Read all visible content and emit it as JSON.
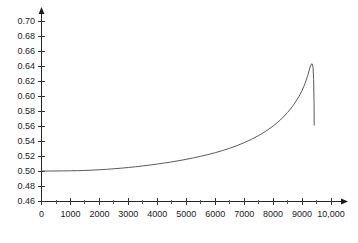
{
  "chart_data": {
    "type": "line",
    "title": "",
    "subtitle": "",
    "xlabel": "",
    "ylabel": "",
    "xlim": [
      0,
      10000
    ],
    "ylim": [
      0.46,
      0.71
    ],
    "grid": false,
    "legend": null,
    "x_tick_labels": [
      "0",
      "1000",
      "2000",
      "3000",
      "4000",
      "5000",
      "6000",
      "7000",
      "8000",
      "9000",
      "10,000"
    ],
    "x_tick_values": [
      0,
      1000,
      2000,
      3000,
      4000,
      5000,
      6000,
      7000,
      8000,
      9000,
      10000
    ],
    "x_minor_tick_values": [
      500,
      1500,
      2500,
      3500,
      4500,
      5500,
      6500,
      7500,
      8500,
      9500
    ],
    "y_tick_labels": [
      "0.46",
      "0.48",
      "0.50",
      "0.52",
      "0.54",
      "0.56",
      "0.58",
      "0.60",
      "0.62",
      "0.64",
      "0.66",
      "0.68",
      "0.70"
    ],
    "y_tick_values": [
      0.46,
      0.48,
      0.5,
      0.52,
      0.54,
      0.56,
      0.58,
      0.6,
      0.62,
      0.64,
      0.66,
      0.68,
      0.7
    ],
    "series": [
      {
        "name": "curve",
        "color": "#5a5a5a",
        "x": [
          0,
          250,
          500,
          750,
          1000,
          1250,
          1500,
          1750,
          2000,
          2250,
          2500,
          2750,
          3000,
          3250,
          3500,
          3750,
          4000,
          4250,
          4500,
          4750,
          5000,
          5250,
          5500,
          5750,
          6000,
          6250,
          6500,
          6750,
          7000,
          7250,
          7500,
          7750,
          8000,
          8250,
          8500,
          8700,
          8900,
          9000,
          9100,
          9200,
          9280,
          9330,
          9360,
          9380,
          9400,
          9415,
          9420
        ],
        "y": [
          0.5005,
          0.5005,
          0.5006,
          0.5007,
          0.5008,
          0.501,
          0.5013,
          0.5017,
          0.5022,
          0.5028,
          0.5035,
          0.5043,
          0.5052,
          0.5062,
          0.5073,
          0.5085,
          0.5098,
          0.5112,
          0.5127,
          0.5143,
          0.5161,
          0.518,
          0.5201,
          0.5224,
          0.5249,
          0.5277,
          0.5308,
          0.5343,
          0.5382,
          0.5426,
          0.5477,
          0.5535,
          0.5603,
          0.5684,
          0.5783,
          0.588,
          0.6,
          0.6075,
          0.6165,
          0.628,
          0.639,
          0.643,
          0.6425,
          0.638,
          0.622,
          0.59,
          0.561
        ]
      }
    ],
    "annotations": {
      "peak_x": 9330,
      "peak_y": 0.643,
      "drop_end_x": 9420,
      "drop_end_y": 0.561,
      "baseline_y": 0.5
    },
    "axis_style": {
      "x_axis_arrow": true,
      "y_axis_arrow": true,
      "axis_color": "#262626",
      "curve_color": "#5a5a5a"
    }
  }
}
